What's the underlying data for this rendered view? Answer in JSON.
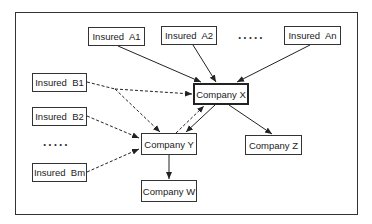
{
  "diagram": {
    "type": "flow",
    "nodes": [
      {
        "id": "A1",
        "label": "Insured  A1",
        "x": 88,
        "y": 27,
        "w": 57,
        "h": 19
      },
      {
        "id": "A2",
        "label": "Insured  A2",
        "x": 161,
        "y": 26,
        "w": 56,
        "h": 19
      },
      {
        "id": "An",
        "label": "Insured  An",
        "x": 284,
        "y": 26,
        "w": 57,
        "h": 19
      },
      {
        "id": "B1",
        "label": "Insured  B1",
        "x": 32,
        "y": 73,
        "w": 55,
        "h": 19
      },
      {
        "id": "B2",
        "label": "Insured  B2",
        "x": 32,
        "y": 107,
        "w": 55,
        "h": 19
      },
      {
        "id": "Bm",
        "label": "Insured  Bm",
        "x": 32,
        "y": 163,
        "w": 55,
        "h": 19
      },
      {
        "id": "X",
        "label": "Company X",
        "x": 193,
        "y": 83,
        "w": 56,
        "h": 22,
        "bold": true
      },
      {
        "id": "Y",
        "label": "Company Y",
        "x": 141,
        "y": 133,
        "w": 56,
        "h": 22
      },
      {
        "id": "Z",
        "label": "Company Z",
        "x": 245,
        "y": 135,
        "w": 57,
        "h": 20
      },
      {
        "id": "W",
        "label": "Company W",
        "x": 141,
        "y": 180,
        "w": 56,
        "h": 22
      }
    ],
    "ellipses": [
      {
        "id": "ellipsis-a",
        "text": ".....",
        "x": 238,
        "y": 30
      },
      {
        "id": "ellipsis-b",
        "text": ".....",
        "x": 43,
        "y": 137
      }
    ],
    "edges": [
      {
        "from": "A1",
        "to": "X",
        "style": "solid"
      },
      {
        "from": "A2",
        "to": "X",
        "style": "solid"
      },
      {
        "from": "An",
        "to": "X",
        "style": "solid"
      },
      {
        "from": "B1",
        "to": "X",
        "style": "dashed"
      },
      {
        "from": "B1",
        "to": "Y",
        "style": "dashed"
      },
      {
        "from": "B2",
        "to": "Y",
        "style": "dashed"
      },
      {
        "from": "Bm",
        "to": "Y",
        "style": "dashed"
      },
      {
        "from": "Y",
        "to": "X",
        "style": "dashed"
      },
      {
        "from": "X",
        "to": "Y",
        "style": "solid"
      },
      {
        "from": "X",
        "to": "Z",
        "style": "solid"
      },
      {
        "from": "Y",
        "to": "W",
        "style": "solid"
      }
    ]
  }
}
